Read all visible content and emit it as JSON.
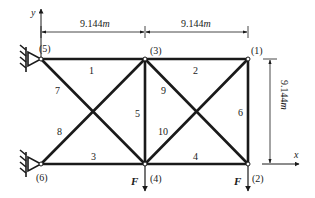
{
  "diagram": {
    "type": "plane-truss",
    "axes": {
      "x_label": "x",
      "y_label": "y"
    },
    "dimensions": {
      "top_left": "9.144",
      "top_right": "9.144",
      "right_vertical": "9.144",
      "unit": "m"
    },
    "nodes": [
      {
        "id": "1",
        "label": "(1)",
        "x": 248,
        "y": 59
      },
      {
        "id": "2",
        "label": "(2)",
        "x": 248,
        "y": 164
      },
      {
        "id": "3",
        "label": "(3)",
        "x": 145,
        "y": 59
      },
      {
        "id": "4",
        "label": "(4)",
        "x": 145,
        "y": 164
      },
      {
        "id": "5",
        "label": "(5)",
        "x": 41,
        "y": 59
      },
      {
        "id": "6",
        "label": "(6)",
        "x": 41,
        "y": 164
      }
    ],
    "elements": [
      {
        "id": "1",
        "label": "1",
        "from": "5",
        "to": "3"
      },
      {
        "id": "2",
        "label": "2",
        "from": "3",
        "to": "1"
      },
      {
        "id": "3",
        "label": "3",
        "from": "6",
        "to": "4"
      },
      {
        "id": "4",
        "label": "4",
        "from": "4",
        "to": "2"
      },
      {
        "id": "5",
        "label": "5",
        "from": "3",
        "to": "4"
      },
      {
        "id": "6",
        "label": "6",
        "from": "1",
        "to": "2"
      },
      {
        "id": "7",
        "label": "7",
        "from": "5",
        "to": "4"
      },
      {
        "id": "8",
        "label": "8",
        "from": "6",
        "to": "3"
      },
      {
        "id": "9",
        "label": "9",
        "from": "3",
        "to": "2"
      },
      {
        "id": "10",
        "label": "10",
        "from": "4",
        "to": "1"
      }
    ],
    "supports": [
      {
        "node": "5",
        "type": "pin"
      },
      {
        "node": "6",
        "type": "pin"
      }
    ],
    "loads": [
      {
        "node": "4",
        "label": "F",
        "direction": "down"
      },
      {
        "node": "2",
        "label": "F",
        "direction": "down"
      }
    ],
    "colors": {
      "member": "#1a1a1a",
      "background": "#ffffff"
    }
  }
}
